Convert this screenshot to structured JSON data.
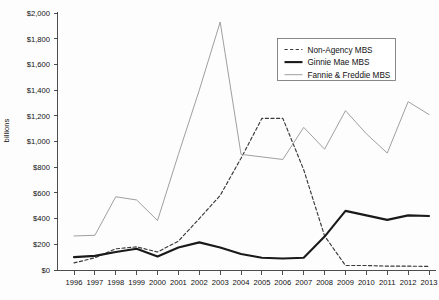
{
  "chart_data": {
    "type": "line",
    "title": "",
    "xlabel": "",
    "ylabel": "billions",
    "ylim": [
      0,
      2000
    ],
    "ytick_values": [
      0,
      200,
      400,
      600,
      800,
      1000,
      1200,
      1400,
      1600,
      1800,
      2000
    ],
    "ytick_labels": [
      "$0",
      "$200",
      "$400",
      "$600",
      "$800",
      "$1,000",
      "$1,200",
      "$1,400",
      "$1,600",
      "$1,800",
      "$2,000"
    ],
    "grid": false,
    "legend_position": "top-right",
    "categories": [
      1996,
      1997,
      1998,
      1999,
      2000,
      2001,
      2002,
      2003,
      2004,
      2005,
      2006,
      2007,
      2008,
      2009,
      2010,
      2011,
      2012,
      2013
    ],
    "xtick_labels": [
      "1996",
      "1997",
      "1998",
      "1999",
      "2000",
      "2001",
      "2002",
      "2003",
      "2004",
      "2005",
      "2006",
      "2007",
      "2008",
      "2009",
      "2010",
      "2011",
      "2012",
      "2013"
    ],
    "series": [
      {
        "name": "Non-Agency MBS",
        "style": "dashed",
        "color": "#3a3a3a",
        "values": [
          55,
          95,
          165,
          180,
          140,
          225,
          400,
          580,
          870,
          1180,
          1180,
          780,
          265,
          35,
          35,
          30,
          30,
          28
        ]
      },
      {
        "name": "Ginnie Mae MBS",
        "style": "solid-thick",
        "color": "#1a1a1a",
        "values": [
          100,
          110,
          140,
          165,
          105,
          175,
          215,
          175,
          125,
          95,
          90,
          95,
          260,
          460,
          425,
          390,
          425,
          420
        ]
      },
      {
        "name": "Fannie & Freddie MBS",
        "style": "solid-thin",
        "color": "#9a9a9a",
        "values": [
          265,
          270,
          570,
          545,
          385,
          900,
          1400,
          1930,
          900,
          880,
          860,
          1110,
          940,
          1240,
          1060,
          910,
          1310,
          1210
        ]
      }
    ]
  },
  "legend": {
    "items": [
      {
        "label": "Non-Agency MBS",
        "style": "dashed"
      },
      {
        "label": "Ginnie Mae MBS",
        "style": "solid-thick"
      },
      {
        "label": "Fannie & Freddie MBS",
        "style": "solid-thin"
      }
    ]
  },
  "colors": {
    "non_agency": "#3a3a3a",
    "ginnie_mae": "#1a1a1a",
    "fannie_freddie": "#9a9a9a",
    "axis": "#3a3a3a",
    "text": "#111111",
    "background": "#fdfdfd"
  }
}
